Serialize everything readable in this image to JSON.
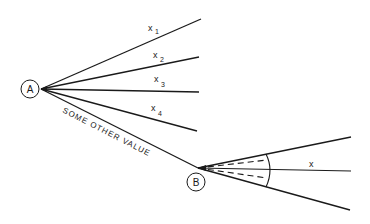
{
  "diagram": {
    "nodes": [
      {
        "id": "A",
        "label": "A"
      },
      {
        "id": "B",
        "label": "B"
      }
    ],
    "branches_from_A": [
      {
        "label": "x",
        "subscript": "1"
      },
      {
        "label": "x",
        "subscript": "2"
      },
      {
        "label": "x",
        "subscript": "3"
      },
      {
        "label": "x",
        "subscript": "4"
      }
    ],
    "edge_A_to_B": {
      "label": "SOME OTHER VALUE"
    },
    "fan_from_B": {
      "label": "x"
    },
    "colors": {
      "line": "#1a1a1a",
      "background": "#ffffff"
    }
  }
}
